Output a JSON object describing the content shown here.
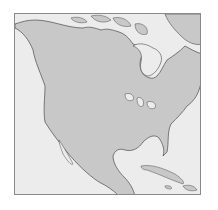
{
  "map": {
    "region": "North America",
    "style": "outline map",
    "colors": {
      "land": "#c8c8c8",
      "water": "#ececec",
      "border": "#8a8a8a",
      "coast": "#4a4a4a",
      "background": "#ffffff"
    },
    "features": [
      {
        "name": "Canada"
      },
      {
        "name": "United States"
      },
      {
        "name": "Mexico"
      },
      {
        "name": "Central America"
      },
      {
        "name": "Greenland"
      },
      {
        "name": "Hudson Bay"
      },
      {
        "name": "Great Lakes"
      },
      {
        "name": "Gulf of Mexico"
      },
      {
        "name": "Caribbean islands"
      },
      {
        "name": "Florida"
      },
      {
        "name": "Baja California"
      },
      {
        "name": "Arctic Archipelago"
      }
    ]
  }
}
